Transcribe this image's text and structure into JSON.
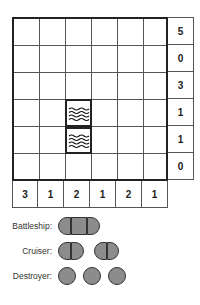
{
  "puzzle": {
    "grid_size": {
      "rows": 6,
      "cols": 6
    },
    "row_clues": [
      "5",
      "0",
      "3",
      "1",
      "1",
      "0"
    ],
    "col_clues": [
      "3",
      "1",
      "2",
      "1",
      "2",
      "1"
    ],
    "water_cells": [
      {
        "row": 3,
        "col": 2
      },
      {
        "row": 4,
        "col": 2
      }
    ]
  },
  "legend": {
    "battleship_label": "Battleship:",
    "cruiser_label": "Cruiser:",
    "destroyer_label": "Destroyer:",
    "ship_color": "#8c8c8c"
  }
}
